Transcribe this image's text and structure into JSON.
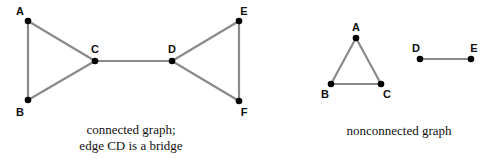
{
  "colors": {
    "edge": "#8a8a8a",
    "node": "#000000",
    "text": "#111111",
    "background": "#ffffff"
  },
  "graphs": [
    {
      "id": "connected",
      "caption_lines": [
        "connected graph;",
        "edge CD is a bridge"
      ],
      "vertices": [
        {
          "label": "A",
          "x": 28,
          "y": 21,
          "lx": 20,
          "ly": 15
        },
        {
          "label": "B",
          "x": 28,
          "y": 100,
          "lx": 20,
          "ly": 116
        },
        {
          "label": "C",
          "x": 95,
          "y": 61,
          "lx": 95,
          "ly": 53
        },
        {
          "label": "D",
          "x": 172,
          "y": 61,
          "lx": 172,
          "ly": 53
        },
        {
          "label": "E",
          "x": 239,
          "y": 21,
          "lx": 244,
          "ly": 15
        },
        {
          "label": "F",
          "x": 239,
          "y": 101,
          "lx": 244,
          "ly": 116
        }
      ],
      "edges": [
        [
          "A",
          "B"
        ],
        [
          "A",
          "C"
        ],
        [
          "B",
          "C"
        ],
        [
          "C",
          "D"
        ],
        [
          "D",
          "E"
        ],
        [
          "D",
          "F"
        ],
        [
          "E",
          "F"
        ]
      ],
      "bridge": [
        "C",
        "D"
      ]
    },
    {
      "id": "nonconnected",
      "caption_lines": [
        "nonconnected graph"
      ],
      "vertices": [
        {
          "label": "A",
          "x": 356,
          "y": 38,
          "lx": 356,
          "ly": 31
        },
        {
          "label": "B",
          "x": 331,
          "y": 84,
          "lx": 325,
          "ly": 98
        },
        {
          "label": "C",
          "x": 381,
          "y": 84,
          "lx": 387,
          "ly": 98
        },
        {
          "label": "D",
          "x": 420,
          "y": 59,
          "lx": 416,
          "ly": 52
        },
        {
          "label": "E",
          "x": 471,
          "y": 59,
          "lx": 474,
          "ly": 52
        }
      ],
      "edges": [
        [
          "A",
          "B"
        ],
        [
          "A",
          "C"
        ],
        [
          "B",
          "C"
        ],
        [
          "D",
          "E"
        ]
      ]
    }
  ]
}
